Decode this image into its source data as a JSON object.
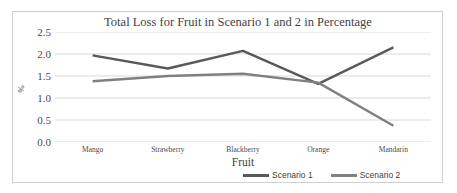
{
  "chart_data": {
    "type": "line",
    "title": "Total Loss for Fruit in Scenario 1 and 2 in Percentage",
    "xlabel": "Fruit",
    "ylabel": "%",
    "categories": [
      "Mango",
      "Strawberry",
      "Blackberry",
      "Orange",
      "Mandarin"
    ],
    "series": [
      {
        "name": "Scenario 1",
        "color": "#595959",
        "values": [
          1.97,
          1.67,
          2.07,
          1.32,
          2.15
        ]
      },
      {
        "name": "Scenario 2",
        "color": "#808080",
        "values": [
          1.38,
          1.5,
          1.55,
          1.35,
          0.37
        ]
      }
    ],
    "ylim": [
      0.0,
      2.5
    ],
    "ytick_labels": [
      "2.5",
      "2.0",
      "1.5",
      "1.0",
      "0.5",
      "0.0"
    ],
    "ytick_values": [
      2.5,
      2.0,
      1.5,
      1.0,
      0.5,
      0.0
    ],
    "grid": "horizontal",
    "gridline_color": "#d9d9d9",
    "legend_position": "bottom",
    "markers": false,
    "border_color": "#d0d0d0"
  }
}
